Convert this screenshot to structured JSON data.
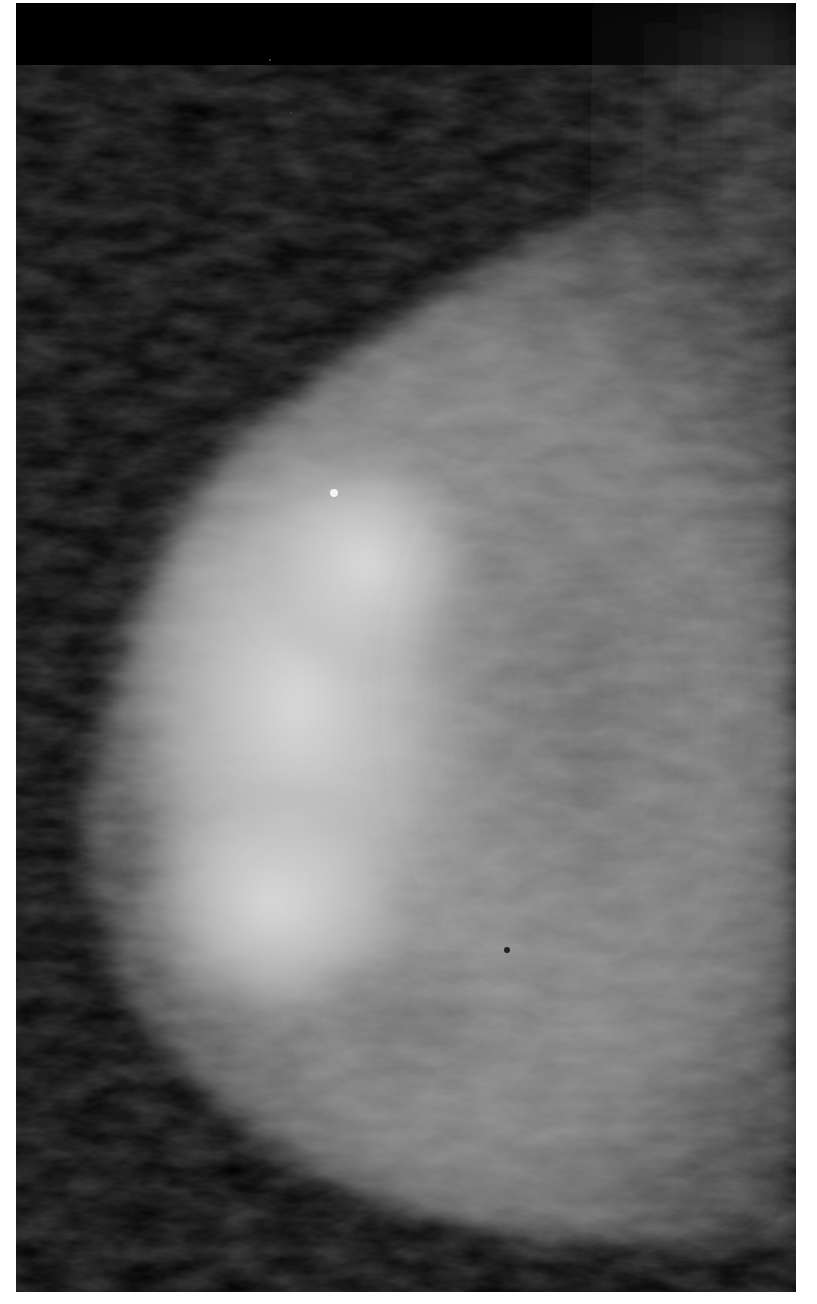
{
  "image": {
    "type": "mammogram",
    "view": "craniocaudal-like, breast tissue facing left",
    "colors": {
      "background": "#000000",
      "border": "#ffffff",
      "tissue_bright": "#d8d8d8",
      "tissue_mid": "#8a8a8a",
      "tissue_dark": "#4a4a4a"
    }
  }
}
